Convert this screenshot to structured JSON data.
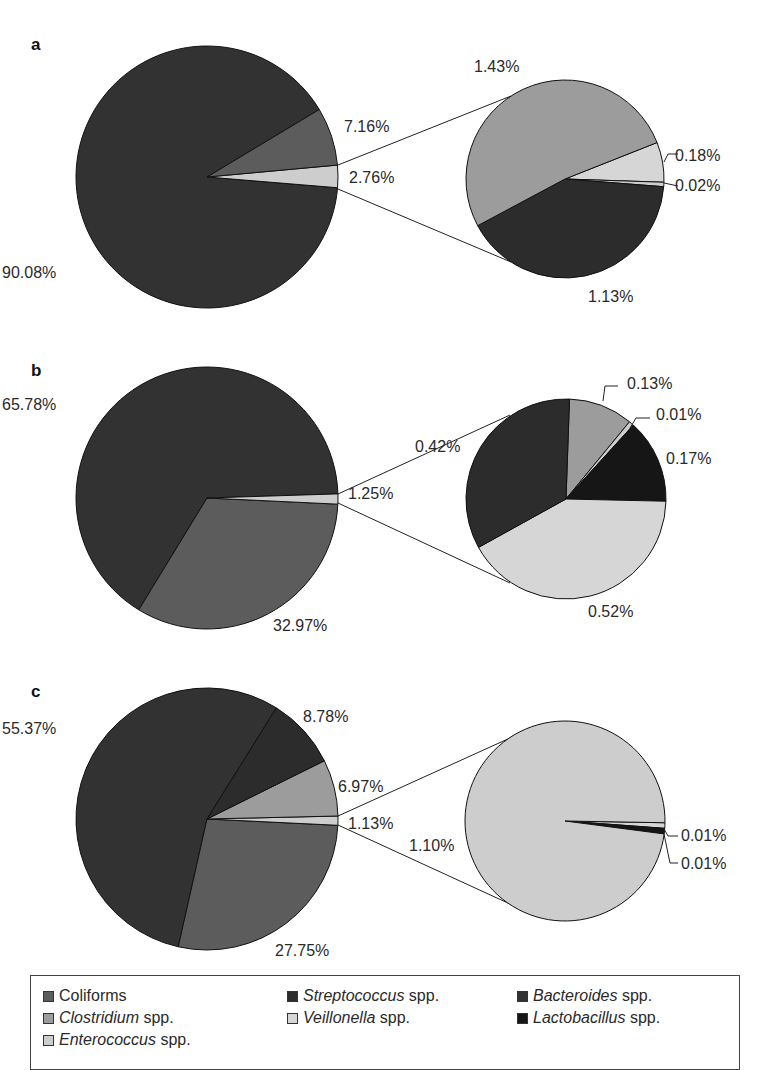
{
  "chart_data": [
    {
      "type": "pie",
      "panel": "a",
      "title": "a",
      "main": {
        "slices": [
          {
            "label": "Bacteroides spp.",
            "value": 90.08,
            "text": "90.08%"
          },
          {
            "label": "Coliforms",
            "value": 7.16,
            "text": "7.16%"
          },
          {
            "label": "Other (exploded)",
            "value": 2.76,
            "text": "2.76%"
          }
        ]
      },
      "exploded": {
        "of": "Other (exploded)",
        "slices": [
          {
            "label": "Clostridium spp.",
            "value": 1.43,
            "text": "1.43%"
          },
          {
            "label": "Veillonella spp.",
            "value": 0.18,
            "text": "0.18%"
          },
          {
            "label": "Enterococcus spp.",
            "value": 0.02,
            "text": "0.02%"
          },
          {
            "label": "Streptococcus spp.",
            "value": 1.13,
            "text": "1.13%"
          }
        ]
      }
    },
    {
      "type": "pie",
      "panel": "b",
      "title": "b",
      "main": {
        "slices": [
          {
            "label": "Bacteroides spp.",
            "value": 65.78,
            "text": "65.78%"
          },
          {
            "label": "Coliforms",
            "value": 32.97,
            "text": "32.97%"
          },
          {
            "label": "Other (exploded)",
            "value": 1.25,
            "text": "1.25%"
          }
        ]
      },
      "exploded": {
        "of": "Other (exploded)",
        "slices": [
          {
            "label": "Streptococcus spp.",
            "value": 0.42,
            "text": "0.42%"
          },
          {
            "label": "Clostridium spp.",
            "value": 0.13,
            "text": "0.13%"
          },
          {
            "label": "Enterococcus spp.",
            "value": 0.01,
            "text": "0.01%"
          },
          {
            "label": "Lactobacillus spp.",
            "value": 0.17,
            "text": "0.17%"
          },
          {
            "label": "Veillonella spp.",
            "value": 0.52,
            "text": "0.52%"
          }
        ]
      }
    },
    {
      "type": "pie",
      "panel": "c",
      "title": "c",
      "main": {
        "slices": [
          {
            "label": "Bacteroides spp.",
            "value": 55.37,
            "text": "55.37%"
          },
          {
            "label": "Streptococcus spp.",
            "value": 8.78,
            "text": "8.78%"
          },
          {
            "label": "Clostridium spp.",
            "value": 6.97,
            "text": "6.97%"
          },
          {
            "label": "Other (exploded)",
            "value": 1.13,
            "text": "1.13%"
          },
          {
            "label": "Coliforms",
            "value": 27.75,
            "text": "27.75%"
          }
        ]
      },
      "exploded": {
        "of": "Other (exploded)",
        "slices": [
          {
            "label": "Enterococcus spp.",
            "value": 1.1,
            "text": "1.10%"
          },
          {
            "label": "Veillonella spp.",
            "value": 0.01,
            "text": "0.01%"
          },
          {
            "label": "Lactobacillus spp.",
            "value": 0.01,
            "text": "0.01%"
          }
        ]
      }
    }
  ],
  "panels": {
    "a": {
      "label": "a"
    },
    "b": {
      "label": "b"
    },
    "c": {
      "label": "c"
    }
  },
  "colors": {
    "Coliforms": "#5c5c5c",
    "Streptococcus spp.": "#2c2c2c",
    "Bacteroides spp.": "#323232",
    "Clostridium spp.": "#9c9c9c",
    "Veillonella spp.": "#d6d6d6",
    "Lactobacillus spp.": "#161616",
    "Enterococcus spp.": "#cdcdcd",
    "Other (exploded)": "#cdcdcd"
  },
  "legend": {
    "items": [
      {
        "italic": "",
        "plain": "Coliforms",
        "key": "Coliforms"
      },
      {
        "italic": "Streptococcus",
        "plain": " spp.",
        "key": "Streptococcus spp."
      },
      {
        "italic": "Bacteroides",
        "plain": " spp.",
        "key": "Bacteroides spp."
      },
      {
        "italic": "Clostridium",
        "plain": " spp.",
        "key": "Clostridium spp."
      },
      {
        "italic": "Veillonella",
        "plain": " spp.",
        "key": "Veillonella spp."
      },
      {
        "italic": "Lactobacillus",
        "plain": " spp.",
        "key": "Lactobacillus spp."
      },
      {
        "italic": "Enterococcus",
        "plain": " spp.",
        "key": "Enterococcus spp."
      }
    ]
  }
}
